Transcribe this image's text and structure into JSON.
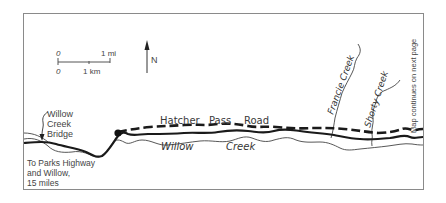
{
  "map": {
    "scale_bar": {
      "top_left_label": "0",
      "top_right_label": "1 mi",
      "bottom_left_label": "0",
      "bottom_mid_label": "1 km"
    },
    "north_arrow": {
      "label": "N",
      "icon": "north-arrow-icon"
    },
    "labels": {
      "bridge_line1": "Willow",
      "bridge_line2": "Creek",
      "bridge_line3": "Bridge",
      "to_parks_line1": "To Parks Highway",
      "to_parks_line2": "and Willow,",
      "to_parks_line3": "15 miles",
      "road_word1": "Hatcher",
      "road_word2": "Pass",
      "road_word3": "Road",
      "creek_word1": "Willow",
      "creek_word2": "Creek",
      "francie_creek": "Francie Creek",
      "shorty_creek": "Shorty Creek",
      "continues": "Map continues on next page"
    },
    "colors": {
      "frame": "#8a8a8a",
      "road": "#1a1a1a",
      "creek": "#444444",
      "text": "#3a3a3a"
    }
  }
}
